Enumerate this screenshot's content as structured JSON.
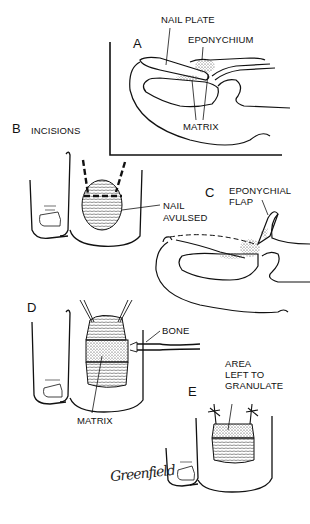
{
  "figure": {
    "panels": [
      {
        "id": "A",
        "letter": "A",
        "labels": {
          "nail_plate": "NAIL PLATE",
          "eponychium": "EPONYCHIUM",
          "matrix": "MATRIX"
        }
      },
      {
        "id": "B",
        "letter": "B",
        "labels": {
          "incisions": "INCISIONS",
          "nail_avulsed_1": "NAIL",
          "nail_avulsed_2": "AVULSED"
        }
      },
      {
        "id": "C",
        "letter": "C",
        "labels": {
          "eponychial_flap_1": "EPONYCHIAL",
          "eponychial_flap_2": "FLAP"
        }
      },
      {
        "id": "D",
        "letter": "D",
        "labels": {
          "bone": "BONE",
          "matrix": "MATRIX"
        }
      },
      {
        "id": "E",
        "letter": "E",
        "labels": {
          "area_1": "AREA",
          "area_2": "LEFT TO",
          "area_3": "GRANULATE"
        }
      }
    ],
    "signature": "Greenfield",
    "colors": {
      "ink": "#111111",
      "background": "#ffffff"
    }
  }
}
